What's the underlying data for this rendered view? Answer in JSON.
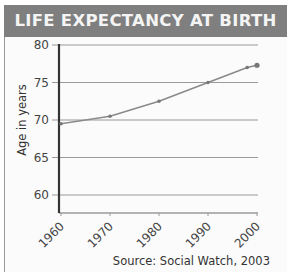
{
  "header": {
    "title": "LIFE EXPECTANCY AT BIRTH"
  },
  "source": "Source: Social Watch, 2003",
  "colors": {
    "header_bg": "#7f7f7f",
    "header_text": "#f4f4f4",
    "line": "#8a8a8a",
    "grid": "#9a9a9a",
    "axis": "#333333"
  },
  "chart_data": {
    "type": "line",
    "title": "LIFE EXPECTANCY AT BIRTH",
    "xlabel": "",
    "ylabel": "Age in years",
    "x": [
      1960,
      1970,
      1980,
      1990,
      1998,
      2000
    ],
    "series": [
      {
        "name": "Life expectancy",
        "values": [
          69.5,
          70.5,
          72.5,
          75.0,
          77.0,
          77.3
        ]
      }
    ],
    "xticks": [
      "1960",
      "1970",
      "1980",
      "1990",
      "2000"
    ],
    "yticks": [
      "60",
      "65",
      "70",
      "75",
      "80"
    ],
    "ylim": [
      57.5,
      80
    ],
    "xlim": [
      1960,
      2000
    ],
    "grid": true,
    "legend": "none",
    "source": "Source: Social Watch, 2003"
  }
}
